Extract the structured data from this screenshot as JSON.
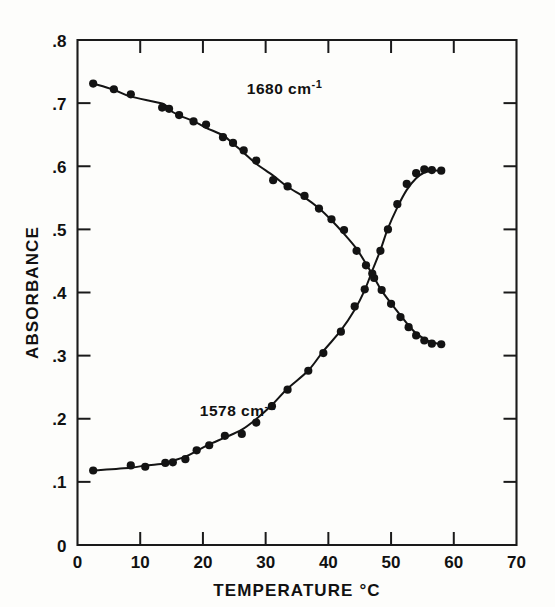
{
  "figure": {
    "background_color": "#fdfdfb",
    "ink_color": "#141414"
  },
  "axis": {
    "y_title": "ABSORBANCE",
    "x_title": "TEMPERATURE °C",
    "y_ticks": [
      "0",
      ".1",
      ".2",
      ".3",
      ".4",
      ".5",
      ".6",
      ".7",
      ".8"
    ],
    "x_ticks": [
      "0",
      "10",
      "20",
      "30",
      "40",
      "50",
      "60",
      "70"
    ]
  },
  "annotations": {
    "upper_label_main": "1680 cm",
    "upper_label_sup": "-1",
    "lower_label_main": "1578 cm",
    "lower_label_sup": "-1"
  },
  "chart_data": {
    "type": "scatter",
    "title": "",
    "xlabel": "TEMPERATURE °C",
    "ylabel": "ABSORBANCE",
    "xlim": [
      0,
      70
    ],
    "ylim": [
      0,
      0.8
    ],
    "xticks": [
      0,
      10,
      20,
      30,
      40,
      50,
      60,
      70
    ],
    "yticks": [
      0,
      0.1,
      0.2,
      0.3,
      0.4,
      0.5,
      0.6,
      0.7,
      0.8
    ],
    "grid": false,
    "legend": "inline-annotations",
    "marker": "filled-circle",
    "fitted_curves": true,
    "series": [
      {
        "name": "1680 cm-1",
        "label_position": {
          "x": 27.0,
          "y": 0.715
        },
        "x": [
          2.5,
          5.8,
          8.5,
          13.5,
          14.6,
          16.2,
          18.5,
          20.5,
          23.2,
          24.8,
          26.5,
          28.5,
          31.2,
          33.5,
          36.2,
          38.5,
          40.5,
          42.5,
          44.5,
          46.0,
          47.3,
          48.5,
          50.0,
          51.5,
          52.8,
          54.0,
          55.3,
          56.5,
          58.0
        ],
        "y": [
          0.731,
          0.722,
          0.714,
          0.693,
          0.691,
          0.681,
          0.671,
          0.666,
          0.646,
          0.637,
          0.625,
          0.609,
          0.578,
          0.568,
          0.553,
          0.533,
          0.516,
          0.499,
          0.466,
          0.443,
          0.423,
          0.404,
          0.382,
          0.361,
          0.345,
          0.332,
          0.324,
          0.319,
          0.318
        ],
        "notes": "decreasing sigmoid; point at 31.2 C lies below fitted curve"
      },
      {
        "name": "1578 cm-1",
        "label_position": {
          "x": 19.5,
          "y": 0.205
        },
        "x": [
          2.5,
          8.5,
          10.8,
          14.0,
          15.2,
          17.2,
          19.0,
          21.0,
          23.5,
          26.2,
          28.5,
          31.0,
          33.5,
          36.8,
          39.2,
          42.0,
          44.2,
          45.8,
          47.0,
          48.3,
          49.5,
          51.0,
          52.5,
          54.0,
          55.3,
          56.5,
          58.0
        ],
        "y": [
          0.118,
          0.126,
          0.124,
          0.13,
          0.131,
          0.136,
          0.15,
          0.158,
          0.173,
          0.176,
          0.194,
          0.22,
          0.246,
          0.276,
          0.304,
          0.338,
          0.378,
          0.405,
          0.43,
          0.466,
          0.5,
          0.54,
          0.572,
          0.589,
          0.595,
          0.594,
          0.593
        ],
        "notes": "increasing sigmoid; point at 23.5 C lies above fitted curve; plateaus near 0.593"
      }
    ],
    "crossing_point": {
      "x": 46.0,
      "y": 0.423
    }
  }
}
